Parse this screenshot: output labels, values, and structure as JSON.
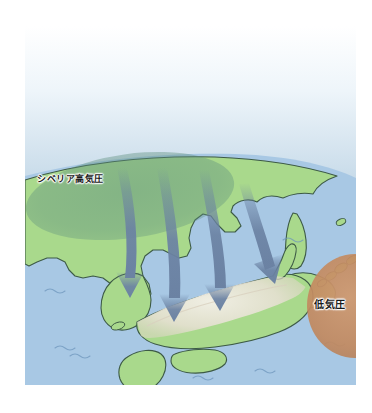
{
  "figure": {
    "title": "",
    "type": "weather-map-illustration",
    "region": "East Asia / Japan in winter"
  },
  "labels": {
    "siberian_high": "シベリア高気圧",
    "low_pressure": "低気圧"
  },
  "colors": {
    "sky_top": "#ffffff",
    "sky_bottom": "#7a9cbf",
    "ocean": "#a8c8e4",
    "land": "#a9d98c",
    "coastline": "#3d5a46",
    "snow": "#e6e0d2",
    "arrow": "#6b82a3",
    "high_pressure_ellipse": "#5e8f7e",
    "low_pressure_ellipse": "#c2895f",
    "paper": "#ffffff"
  },
  "elements": {
    "high_pressure_system": {
      "name": "シベリア高気圧",
      "shape": "ellipse",
      "cx": 105,
      "cy": 170,
      "rx": 105,
      "ry": 42,
      "rotation": -8,
      "fill": "#5e8f7e",
      "opacity": 0.45
    },
    "low_pressure_system": {
      "name": "低気圧",
      "shape": "ellipse",
      "cx": 330,
      "cy": 280,
      "rx": 48,
      "ry": 52,
      "fill": "#c2895f",
      "opacity": 0.85
    },
    "wind_arrows": [
      {
        "id": "arrow-1",
        "from_x": 118,
        "from_y": 168,
        "to_x": 105,
        "to_y": 292,
        "label": "cold northwest monsoon"
      },
      {
        "id": "arrow-2",
        "from_x": 160,
        "from_y": 168,
        "to_x": 152,
        "to_y": 318,
        "label": "cold northwest monsoon"
      },
      {
        "id": "arrow-3",
        "from_x": 200,
        "from_y": 170,
        "to_x": 196,
        "to_y": 305,
        "label": "cold northwest monsoon"
      },
      {
        "id": "arrow-4",
        "from_x": 232,
        "from_y": 185,
        "to_x": 238,
        "to_y": 288,
        "label": "cold northwest monsoon"
      }
    ],
    "snow_region": {
      "name": "Sea-of-Japan-side snowfall belt",
      "fill": "#e6e0d2"
    },
    "sea_waves_count": 7,
    "landmasses": [
      "Eurasian continent (Siberia / China)",
      "Korean Peninsula",
      "Sakhalin",
      "Hokkaido",
      "Honshu",
      "Shikoku",
      "Kyushu",
      "Kuril Islands"
    ]
  }
}
